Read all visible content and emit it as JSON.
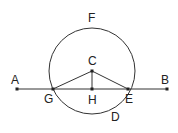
{
  "diagram": {
    "type": "geometry-circle-chord",
    "labels": {
      "A": "A",
      "B": "B",
      "C": "C",
      "D": "D",
      "E": "E",
      "F": "F",
      "G": "G",
      "H": "H"
    },
    "circle": {
      "center": "C",
      "cx": 92,
      "cy": 71,
      "r": 43
    },
    "line": {
      "from": "A",
      "to": "B",
      "y": 89
    },
    "points": {
      "A": [
        17,
        89
      ],
      "B": [
        167,
        89
      ],
      "C": [
        92,
        71
      ],
      "G": [
        53,
        89
      ],
      "H": [
        92,
        89
      ],
      "E": [
        128,
        89
      ]
    },
    "segments": [
      "CG",
      "CE",
      "CH"
    ]
  }
}
